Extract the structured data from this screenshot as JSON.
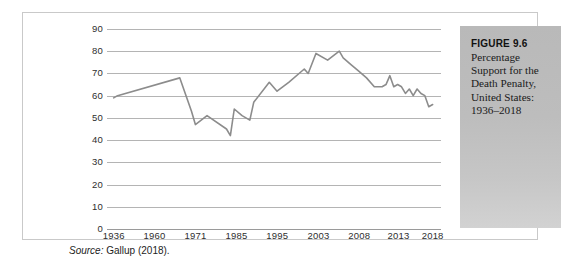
{
  "figure": {
    "caption_title": "FIGURE 9.6",
    "caption_body": "Percentage Support for the Death Penalty, United States: 1936–2018",
    "source_label": "Source:",
    "source_text": " Gallup (2018)."
  },
  "colors": {
    "line": "#8c8c8c",
    "gridline": "#b4b4b4",
    "baseline": "#9a9a9a",
    "frame": "#c9c9c9",
    "caption_panel_top": "#b9b9b9",
    "caption_panel_bottom": "#d2d2d2",
    "text": "#2e2e2e"
  },
  "chart_data": {
    "type": "line",
    "title": "Percentage Support for the Death Penalty, United States: 1936–2018",
    "xlabel": "",
    "ylabel": "",
    "ylim": [
      0,
      90
    ],
    "ytick_step": 10,
    "yticks": [
      90,
      80,
      70,
      60,
      50,
      40,
      30,
      20,
      10,
      0
    ],
    "grid": true,
    "legend": false,
    "xticks": [
      "1936",
      "1960",
      "1971",
      "1985",
      "1995",
      "2003",
      "2008",
      "2013",
      "2018"
    ],
    "xtick_positions_pct": [
      2.0,
      14.2,
      26.5,
      38.8,
      51.0,
      63.3,
      75.5,
      87.3,
      97.5
    ],
    "series": [
      {
        "name": "Percentage support for the death penalty",
        "x": [
          1936,
          1937,
          1953,
          1956,
          1957,
          1960,
          1965,
          1966,
          1967,
          1969,
          1971,
          1972,
          1976,
          1978,
          1981,
          1985,
          1986,
          1988,
          1991,
          1994,
          1995,
          1997,
          1999,
          2001,
          2003,
          2005,
          2006,
          2007,
          2008,
          2009,
          2010,
          2011,
          2012,
          2013,
          2014,
          2015,
          2016,
          2017,
          2018
        ],
        "values": [
          59,
          60,
          68,
          53,
          47,
          51,
          45,
          42,
          54,
          51,
          49,
          57,
          66,
          62,
          66,
          72,
          70,
          79,
          76,
          80,
          77,
          74,
          71,
          68,
          64,
          64,
          65,
          69,
          64,
          65,
          64,
          61,
          63,
          60,
          63,
          61,
          60,
          55,
          56
        ],
        "color": "#8c8c8c",
        "marker": "none",
        "linewidth": 1.6
      }
    ]
  }
}
